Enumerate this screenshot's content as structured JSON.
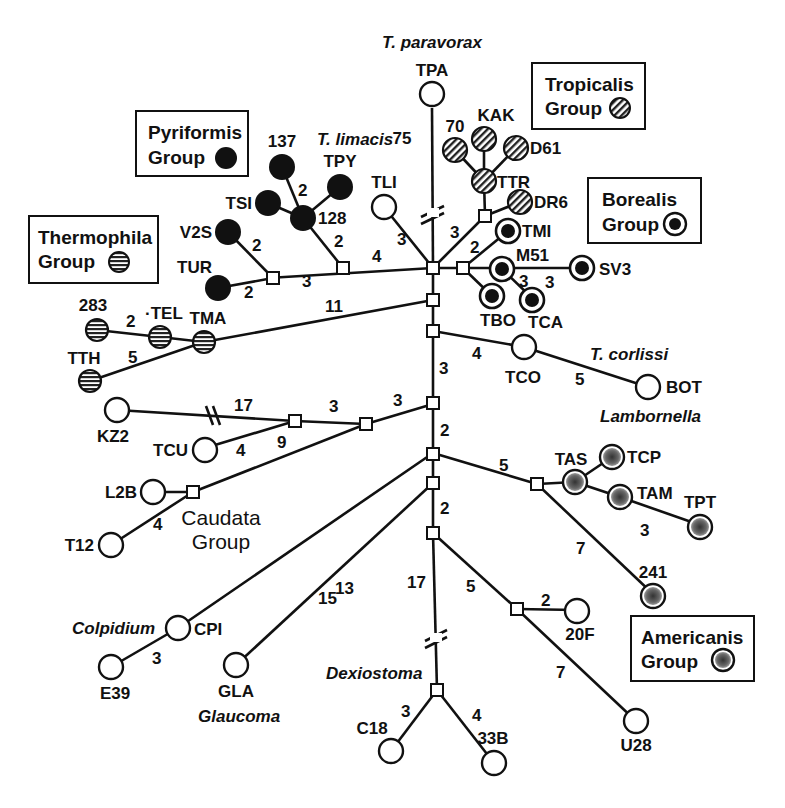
{
  "figure": {
    "type": "haplotype network",
    "groups": [
      {
        "name": "Pyriformis Group",
        "line1": "Pyriformis",
        "line2": "Group",
        "symbol": "solid-black"
      },
      {
        "name": "Thermophila Group",
        "line1": "Thermophila",
        "line2": "Group",
        "symbol": "horizontal-stripes"
      },
      {
        "name": "Tropicalis Group",
        "line1": "Tropicalis",
        "line2": "Group",
        "symbol": "diagonal-hatch"
      },
      {
        "name": "Borealis Group",
        "line1": "Borealis",
        "line2": "Group",
        "symbol": "ring-with-black-center"
      },
      {
        "name": "Americanis Group",
        "line1": "Americanis",
        "line2": "Group",
        "symbol": "ring-with-stippled-center"
      },
      {
        "name": "Caudata Group",
        "line1": "Caudata",
        "line2": "Group",
        "symbol": "open"
      }
    ],
    "taxon_labels": {
      "paravorax": "T. paravorax",
      "limacis": "T. limacis",
      "corlissi": "T. corlissi",
      "lambornella": "Lambornella",
      "colpidium": "Colpidium",
      "glaucoma": "Glaucoma",
      "dexiostoma": "Dexiostoma"
    },
    "nodes": [
      {
        "id": "TPA",
        "label": "TPA",
        "type": "open"
      },
      {
        "id": "TLI",
        "label": "TLI",
        "type": "open"
      },
      {
        "id": "137",
        "label": "137",
        "type": "solid"
      },
      {
        "id": "TPY",
        "label": "TPY",
        "type": "solid"
      },
      {
        "id": "TSI",
        "label": "TSI",
        "type": "solid"
      },
      {
        "id": "128",
        "label": "128",
        "type": "solid"
      },
      {
        "id": "V2S",
        "label": "V2S",
        "type": "solid"
      },
      {
        "id": "TUR",
        "label": "TUR",
        "type": "solid"
      },
      {
        "id": "70",
        "label": "70",
        "type": "hatch"
      },
      {
        "id": "KAK",
        "label": "KAK",
        "type": "hatch"
      },
      {
        "id": "D61",
        "label": "D61",
        "type": "hatch"
      },
      {
        "id": "TTR",
        "label": "TTR",
        "type": "hatch"
      },
      {
        "id": "DR6",
        "label": "DR6",
        "type": "hatch"
      },
      {
        "id": "TMI",
        "label": "TMI",
        "type": "ring"
      },
      {
        "id": "M51",
        "label": "M51",
        "type": "ring"
      },
      {
        "id": "SV3",
        "label": "SV3",
        "type": "ring"
      },
      {
        "id": "TBO",
        "label": "TBO",
        "type": "ring"
      },
      {
        "id": "TCA",
        "label": "TCA",
        "type": "ring"
      },
      {
        "id": "283",
        "label": "283",
        "type": "stripes"
      },
      {
        "id": "TEL",
        "label": "·TEL",
        "type": "stripes"
      },
      {
        "id": "TMA",
        "label": "TMA",
        "type": "stripes"
      },
      {
        "id": "TTH",
        "label": "TTH",
        "type": "stripes"
      },
      {
        "id": "TCO",
        "label": "TCO",
        "type": "open"
      },
      {
        "id": "BOT",
        "label": "BOT",
        "type": "open"
      },
      {
        "id": "KZ2",
        "label": "KZ2",
        "type": "open"
      },
      {
        "id": "TCU",
        "label": "TCU",
        "type": "open"
      },
      {
        "id": "L2B",
        "label": "L2B",
        "type": "open"
      },
      {
        "id": "T12",
        "label": "T12",
        "type": "open"
      },
      {
        "id": "TAS",
        "label": "TAS",
        "type": "stipple"
      },
      {
        "id": "TCP",
        "label": "TCP",
        "type": "stipple"
      },
      {
        "id": "TAM",
        "label": "TAM",
        "type": "stipple"
      },
      {
        "id": "TPT",
        "label": "TPT",
        "type": "stipple"
      },
      {
        "id": "241",
        "label": "241",
        "type": "stipple"
      },
      {
        "id": "20F",
        "label": "20F",
        "type": "open"
      },
      {
        "id": "U28",
        "label": "U28",
        "type": "open"
      },
      {
        "id": "CPI",
        "label": "CPI",
        "type": "open"
      },
      {
        "id": "E39",
        "label": "E39",
        "type": "open"
      },
      {
        "id": "GLA",
        "label": "GLA",
        "type": "open"
      },
      {
        "id": "C18",
        "label": "C18",
        "type": "open"
      },
      {
        "id": "33B",
        "label": "33B",
        "type": "open"
      }
    ],
    "edge_weights": {
      "TPA_stem": "75",
      "TLI": "3",
      "pyr_to_center": "4",
      "pyr_inner": "3",
      "pyr_128": "2",
      "pyr_137": "2",
      "V2S": "2",
      "TUR": "2",
      "trop": "3",
      "bor": "2",
      "SV3": "3",
      "TCA": "3",
      "therm": "11",
      "TEL": "2",
      "TTH": "5",
      "TCO": "4",
      "BOT": "5",
      "main_3": "3",
      "main_2a": "2",
      "main_2b": "2",
      "caud_3a": "3",
      "caud_3b": "3",
      "KZ2": "17",
      "TCU": "4",
      "caud_9": "9",
      "T12": "4",
      "amer_5": "5",
      "TPT": "3",
      "241": "7",
      "CPI_15": "15",
      "GLA_13": "13",
      "dex_17": "17",
      "20F_branch": "5",
      "20F": "2",
      "U28": "7",
      "E39": "3",
      "C18": "3",
      "33B": "4"
    }
  }
}
